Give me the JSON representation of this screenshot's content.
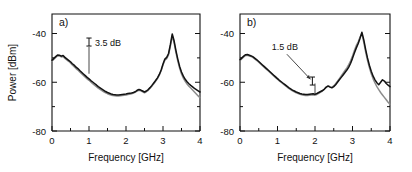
{
  "figure": {
    "width": 412,
    "height": 172,
    "background": "#ffffff",
    "trace_colors": {
      "black": "#121212",
      "gray": "#8c8c8c"
    }
  },
  "chart_data": [
    {
      "type": "line",
      "panel_label": "a)",
      "title": "",
      "xlabel": "Frequency [GHz]",
      "ylabel": "Power [dBm]",
      "xlim": [
        0,
        4
      ],
      "ylim": [
        -80,
        -32
      ],
      "xticks": [
        0,
        1,
        2,
        3,
        4
      ],
      "xticklabels": [
        "0",
        "1",
        "2",
        "3",
        "4"
      ],
      "xminorticks": [
        0.5,
        1.5,
        2.5,
        3.5
      ],
      "yticks": [
        -40,
        -60,
        -80
      ],
      "yticklabels": [
        "-40",
        "-60",
        "-80"
      ],
      "yminorticks": [
        -50,
        -70
      ],
      "grid": false,
      "legend": "none",
      "annotations": [
        {
          "text": "3.5 dB",
          "value": 3.5,
          "units": "dB",
          "marker": "errorbar",
          "marker_x": 1.0,
          "marker_y": -43.5,
          "pointer_x": 1.0,
          "pointer_y_from": -45.5,
          "pointer_y_to": -56.5
        }
      ],
      "series": [
        {
          "name": "black",
          "color": "#121212",
          "x": [
            0.0,
            0.05,
            0.1,
            0.15,
            0.2,
            0.25,
            0.3,
            0.35,
            0.4,
            0.45,
            0.5,
            0.55,
            0.6,
            0.65,
            0.7,
            0.75,
            0.8,
            0.85,
            0.9,
            0.95,
            1.0,
            1.05,
            1.1,
            1.15,
            1.2,
            1.25,
            1.3,
            1.35,
            1.4,
            1.45,
            1.5,
            1.55,
            1.6,
            1.65,
            1.7,
            1.75,
            1.8,
            1.85,
            1.9,
            1.95,
            2.0,
            2.05,
            2.1,
            2.15,
            2.2,
            2.25,
            2.3,
            2.35,
            2.4,
            2.45,
            2.5,
            2.55,
            2.6,
            2.65,
            2.7,
            2.75,
            2.8,
            2.85,
            2.9,
            2.95,
            3.0,
            3.05,
            3.1,
            3.15,
            3.2,
            3.25,
            3.3,
            3.35,
            3.4,
            3.45,
            3.5,
            3.55,
            3.6,
            3.65,
            3.7,
            3.75,
            3.8,
            3.85,
            3.9,
            3.95,
            4.0
          ],
          "y": [
            -51.0,
            -50.2,
            -49.5,
            -48.8,
            -48.9,
            -49.3,
            -49.0,
            -49.8,
            -50.4,
            -51.0,
            -51.6,
            -52.4,
            -53.0,
            -53.8,
            -54.4,
            -55.2,
            -55.9,
            -56.6,
            -57.3,
            -58.0,
            -58.6,
            -59.3,
            -59.9,
            -60.5,
            -61.1,
            -61.8,
            -62.3,
            -62.8,
            -63.3,
            -63.8,
            -64.2,
            -64.5,
            -64.8,
            -65.0,
            -65.1,
            -65.2,
            -65.2,
            -65.1,
            -65.0,
            -64.9,
            -64.8,
            -64.6,
            -64.5,
            -64.4,
            -64.2,
            -63.9,
            -63.3,
            -63.0,
            -63.2,
            -63.6,
            -64.0,
            -63.6,
            -63.0,
            -62.2,
            -61.3,
            -60.3,
            -59.3,
            -58.2,
            -56.8,
            -55.0,
            -52.5,
            -50.5,
            -49.8,
            -48.2,
            -44.5,
            -40.2,
            -43.0,
            -47.0,
            -50.5,
            -53.5,
            -55.8,
            -57.5,
            -58.8,
            -59.8,
            -60.6,
            -61.3,
            -61.9,
            -62.5,
            -63.0,
            -63.5,
            -64.0
          ]
        },
        {
          "name": "gray",
          "color": "#8c8c8c",
          "x": [
            0.0,
            0.05,
            0.1,
            0.15,
            0.2,
            0.25,
            0.3,
            0.35,
            0.4,
            0.45,
            0.5,
            0.55,
            0.6,
            0.65,
            0.7,
            0.75,
            0.8,
            0.85,
            0.9,
            0.95,
            1.0,
            1.05,
            1.1,
            1.15,
            1.2,
            1.25,
            1.3,
            1.35,
            1.4,
            1.45,
            1.5,
            1.55,
            1.6,
            1.65,
            1.7,
            1.75,
            1.8,
            1.85,
            1.9,
            1.95,
            2.0,
            2.05,
            2.1,
            2.15,
            2.2,
            2.25,
            2.3,
            2.35,
            2.4,
            2.45,
            2.5,
            2.55,
            2.6,
            2.65,
            2.7,
            2.75,
            2.8,
            2.85,
            2.9,
            2.95,
            3.0,
            3.05,
            3.1,
            3.15,
            3.2,
            3.25,
            3.3,
            3.35,
            3.4,
            3.45,
            3.5,
            3.55,
            3.6,
            3.65,
            3.7,
            3.75,
            3.8,
            3.85,
            3.9,
            3.95,
            4.0
          ],
          "y": [
            -51.4,
            -50.6,
            -49.8,
            -49.2,
            -49.2,
            -49.6,
            -49.4,
            -50.2,
            -50.8,
            -51.4,
            -52.1,
            -52.9,
            -53.6,
            -54.4,
            -55.0,
            -55.8,
            -56.5,
            -57.2,
            -57.9,
            -58.6,
            -59.2,
            -59.9,
            -60.6,
            -61.2,
            -61.8,
            -62.4,
            -62.9,
            -63.4,
            -63.9,
            -64.3,
            -64.7,
            -65.0,
            -65.3,
            -65.4,
            -65.5,
            -65.6,
            -65.6,
            -65.5,
            -65.4,
            -65.3,
            -65.2,
            -65.0,
            -64.9,
            -64.7,
            -64.4,
            -64.1,
            -63.6,
            -63.3,
            -63.5,
            -63.9,
            -64.3,
            -63.9,
            -63.3,
            -62.5,
            -61.6,
            -60.6,
            -59.6,
            -58.5,
            -57.1,
            -55.3,
            -52.9,
            -51.0,
            -50.3,
            -48.8,
            -45.2,
            -41.0,
            -43.8,
            -47.8,
            -51.3,
            -54.3,
            -56.6,
            -58.3,
            -59.6,
            -60.7,
            -61.6,
            -62.4,
            -63.2,
            -64.0,
            -64.8,
            -65.6,
            -66.3
          ]
        }
      ]
    },
    {
      "type": "line",
      "panel_label": "b)",
      "title": "",
      "xlabel": "Frequency [GHz]",
      "ylabel": "",
      "xlim": [
        0,
        4
      ],
      "ylim": [
        -80,
        -32
      ],
      "xticks": [
        0,
        1,
        2,
        3,
        4
      ],
      "xticklabels": [
        "0",
        "1",
        "2",
        "3",
        "4"
      ],
      "xminorticks": [
        0.5,
        1.5,
        2.5,
        3.5
      ],
      "yticks": [
        -40,
        -60,
        -80
      ],
      "yticklabels": [
        "-40",
        "-60",
        "-80"
      ],
      "yminorticks": [
        -50,
        -70
      ],
      "grid": false,
      "legend": "none",
      "annotations": [
        {
          "text": "1.5 dB",
          "value": 1.5,
          "units": "dB",
          "marker": "errorbar",
          "marker_x": 1.93,
          "marker_y": -59.5,
          "pointer_x": 2.0,
          "pointer_y_from": -60.5,
          "pointer_y_to": -64.5,
          "arrow_from_x": 1.25,
          "arrow_from_y": -48.5,
          "arrow_to_x": 1.88,
          "arrow_to_y": -58.8
        }
      ],
      "series": [
        {
          "name": "black",
          "color": "#121212",
          "x": [
            0.0,
            0.05,
            0.1,
            0.15,
            0.2,
            0.25,
            0.3,
            0.35,
            0.4,
            0.45,
            0.5,
            0.55,
            0.6,
            0.65,
            0.7,
            0.75,
            0.8,
            0.85,
            0.9,
            0.95,
            1.0,
            1.05,
            1.1,
            1.15,
            1.2,
            1.25,
            1.3,
            1.35,
            1.4,
            1.45,
            1.5,
            1.55,
            1.6,
            1.65,
            1.7,
            1.75,
            1.8,
            1.85,
            1.9,
            1.95,
            2.0,
            2.05,
            2.1,
            2.15,
            2.2,
            2.25,
            2.3,
            2.35,
            2.4,
            2.45,
            2.5,
            2.55,
            2.6,
            2.65,
            2.7,
            2.75,
            2.8,
            2.85,
            2.9,
            2.95,
            3.0,
            3.05,
            3.1,
            3.15,
            3.2,
            3.25,
            3.3,
            3.35,
            3.4,
            3.45,
            3.5,
            3.55,
            3.6,
            3.65,
            3.7,
            3.75,
            3.8,
            3.85,
            3.9,
            3.95,
            4.0
          ],
          "y": [
            -50.8,
            -50.0,
            -49.3,
            -48.7,
            -48.6,
            -48.9,
            -49.2,
            -49.6,
            -50.2,
            -50.8,
            -51.5,
            -52.2,
            -52.9,
            -53.6,
            -54.3,
            -55.0,
            -55.7,
            -56.4,
            -57.1,
            -57.8,
            -58.5,
            -59.2,
            -59.8,
            -60.4,
            -61.0,
            -61.6,
            -62.2,
            -62.7,
            -63.2,
            -63.6,
            -64.0,
            -64.3,
            -64.6,
            -64.8,
            -64.9,
            -65.0,
            -65.0,
            -64.9,
            -64.8,
            -64.7,
            -64.9,
            -64.6,
            -64.2,
            -63.8,
            -63.4,
            -62.8,
            -62.0,
            -61.6,
            -62.0,
            -62.3,
            -61.8,
            -61.0,
            -60.0,
            -59.0,
            -58.0,
            -57.0,
            -56.0,
            -55.0,
            -53.8,
            -52.2,
            -50.2,
            -48.0,
            -46.0,
            -44.2,
            -42.0,
            -39.5,
            -42.5,
            -46.5,
            -50.0,
            -53.0,
            -55.5,
            -57.5,
            -59.0,
            -60.2,
            -61.0,
            -60.0,
            -59.0,
            -59.5,
            -60.5,
            -61.2,
            -61.8
          ]
        },
        {
          "name": "gray",
          "color": "#8c8c8c",
          "x": [
            0.0,
            0.05,
            0.1,
            0.15,
            0.2,
            0.25,
            0.3,
            0.35,
            0.4,
            0.45,
            0.5,
            0.55,
            0.6,
            0.65,
            0.7,
            0.75,
            0.8,
            0.85,
            0.9,
            0.95,
            1.0,
            1.05,
            1.1,
            1.15,
            1.2,
            1.25,
            1.3,
            1.35,
            1.4,
            1.45,
            1.5,
            1.55,
            1.6,
            1.65,
            1.7,
            1.75,
            1.8,
            1.85,
            1.9,
            1.95,
            2.0,
            2.05,
            2.1,
            2.15,
            2.2,
            2.25,
            2.3,
            2.35,
            2.4,
            2.45,
            2.5,
            2.55,
            2.6,
            2.65,
            2.7,
            2.75,
            2.8,
            2.85,
            2.9,
            2.95,
            3.0,
            3.05,
            3.1,
            3.15,
            3.2,
            3.25,
            3.3,
            3.35,
            3.4,
            3.45,
            3.5,
            3.55,
            3.6,
            3.65,
            3.7,
            3.75,
            3.8,
            3.85,
            3.9,
            3.95,
            4.0
          ],
          "y": [
            -51.1,
            -50.3,
            -49.6,
            -49.0,
            -48.9,
            -49.2,
            -49.5,
            -49.9,
            -50.5,
            -51.1,
            -51.8,
            -52.5,
            -53.2,
            -53.9,
            -54.6,
            -55.3,
            -56.0,
            -56.7,
            -57.4,
            -58.1,
            -58.8,
            -59.5,
            -60.1,
            -60.7,
            -61.3,
            -61.9,
            -62.5,
            -63.0,
            -63.5,
            -63.9,
            -64.3,
            -64.6,
            -64.9,
            -65.1,
            -65.3,
            -65.4,
            -65.4,
            -65.3,
            -65.2,
            -65.1,
            -65.3,
            -65.0,
            -64.6,
            -64.1,
            -63.6,
            -62.9,
            -62.0,
            -61.4,
            -61.8,
            -62.1,
            -61.5,
            -60.6,
            -59.6,
            -58.5,
            -57.4,
            -56.3,
            -55.2,
            -54.1,
            -52.8,
            -51.2,
            -49.2,
            -47.0,
            -45.0,
            -43.5,
            -41.5,
            -40.2,
            -43.5,
            -47.5,
            -51.0,
            -54.0,
            -56.5,
            -58.6,
            -60.3,
            -61.8,
            -63.0,
            -64.2,
            -65.2,
            -66.2,
            -67.2,
            -68.2,
            -69.0
          ]
        }
      ]
    }
  ]
}
